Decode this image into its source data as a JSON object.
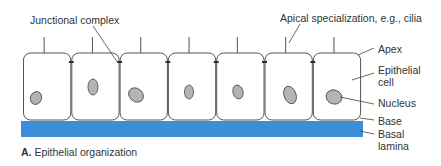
{
  "figure": {
    "caption_letter": "A.",
    "caption_text": "Epithelial organization",
    "labels": {
      "junctional_complex": "Junctional complex",
      "apical_specialization": "Apical specialization, e.g., cilia",
      "apex": "Apex",
      "epithelial_cell_line1": "Epithelial",
      "epithelial_cell_line2": "cell",
      "nucleus": "Nucleus",
      "base": "Base",
      "basal_lamina_line1": "Basal",
      "basal_lamina_line2": "lamina"
    },
    "colors": {
      "basal_lamina": "#3b8fd8",
      "cell_outline": "#555555",
      "cell_fill": "#ffffff",
      "nucleus_fill": "#b4b4b4",
      "nucleus_outline": "#555555",
      "leader_line": "#444444"
    },
    "cells": [
      {
        "x": 23,
        "nucleus": {
          "cx": 36,
          "cy": 98,
          "rx": 5.5,
          "ry": 6.5,
          "rot": 20
        }
      },
      {
        "x": 71.3,
        "nucleus": {
          "cx": 93,
          "cy": 87,
          "rx": 5,
          "ry": 8,
          "rot": 0
        }
      },
      {
        "x": 119.6,
        "nucleus": {
          "cx": 136,
          "cy": 95,
          "rx": 8,
          "ry": 6.5,
          "rot": 40
        }
      },
      {
        "x": 167.9,
        "nucleus": {
          "cx": 189,
          "cy": 92,
          "rx": 4.5,
          "ry": 7,
          "rot": 0
        }
      },
      {
        "x": 216.2,
        "nucleus": {
          "cx": 238,
          "cy": 92,
          "rx": 5,
          "ry": 7,
          "rot": -15
        }
      },
      {
        "x": 264.5,
        "nucleus": {
          "cx": 290,
          "cy": 95,
          "rx": 6,
          "ry": 9,
          "rot": -20
        }
      },
      {
        "x": 312.8,
        "nucleus": {
          "cx": 334,
          "cy": 97,
          "rx": 8,
          "ry": 7,
          "rot": 20
        }
      }
    ],
    "cell_geometry": {
      "y_top": 53,
      "y_bottom": 120,
      "width": 48.3,
      "radius": 7
    },
    "basal_lamina_rect": {
      "x": 21,
      "y": 121,
      "width": 342,
      "height": 16
    },
    "cilium_height": 16
  }
}
